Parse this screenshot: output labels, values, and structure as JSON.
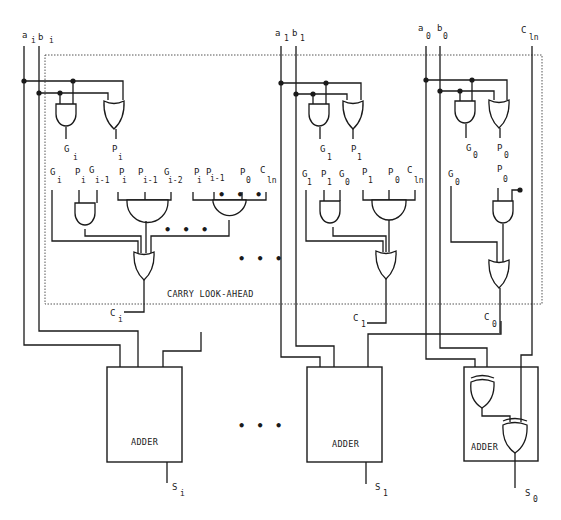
{
  "colors": {
    "line": "#1a1a1a",
    "background": "#ffffff",
    "boundary": "#555555"
  },
  "carry_lookahead_label": "CARRY LOOK-AHEAD",
  "ellipsis": "• • •",
  "stages": [
    {
      "id": "stage-i",
      "inputs": {
        "a": "a",
        "a_sub": "i",
        "b": "b",
        "b_sub": "i"
      },
      "gp_outputs": {
        "g": "G",
        "g_sub": "i",
        "p": "P",
        "p_sub": "i"
      },
      "carry_terms": [
        {
          "name": "G",
          "sub": "i"
        },
        {
          "name": "P",
          "sub": "i"
        },
        {
          "name": "G",
          "sub": "i-1"
        },
        {
          "name": "P",
          "sub": "i"
        },
        {
          "name": "P",
          "sub": "i-1"
        },
        {
          "name": "G",
          "sub": "i-2"
        },
        {
          "name": "P",
          "sub": "i"
        },
        {
          "name": "P",
          "sub": "i-1"
        },
        {
          "name": "P",
          "sub": "0"
        },
        {
          "name": "C",
          "sub": "ln"
        }
      ],
      "carry_out": {
        "name": "C",
        "sub": "i"
      },
      "adder_label": "ADDER",
      "sum": {
        "name": "S",
        "sub": "i"
      }
    },
    {
      "id": "stage-1",
      "inputs": {
        "a": "a",
        "a_sub": "1",
        "b": "b",
        "b_sub": "1"
      },
      "gp_outputs": {
        "g": "G",
        "g_sub": "1",
        "p": "P",
        "p_sub": "1"
      },
      "carry_terms": [
        {
          "name": "G",
          "sub": "1"
        },
        {
          "name": "P",
          "sub": "1"
        },
        {
          "name": "G",
          "sub": "0"
        },
        {
          "name": "P",
          "sub": "1"
        },
        {
          "name": "P",
          "sub": "0"
        },
        {
          "name": "C",
          "sub": "ln"
        }
      ],
      "carry_out": {
        "name": "C",
        "sub": "1"
      },
      "adder_label": "ADDER",
      "sum": {
        "name": "S",
        "sub": "1"
      }
    },
    {
      "id": "stage-0",
      "inputs": {
        "a": "a",
        "a_sub": "0",
        "b": "b",
        "b_sub": "0",
        "cin": "C",
        "cin_sub": "ln"
      },
      "gp_outputs": {
        "g": "G",
        "g_sub": "0",
        "p": "P",
        "p_sub": "0"
      },
      "carry_terms": [
        {
          "name": "G",
          "sub": "0"
        },
        {
          "name": "P",
          "sub": "0"
        }
      ],
      "carry_out": {
        "name": "C",
        "sub": "0"
      },
      "adder_label": "ADDER",
      "sum": {
        "name": "S",
        "sub": "0"
      }
    }
  ]
}
